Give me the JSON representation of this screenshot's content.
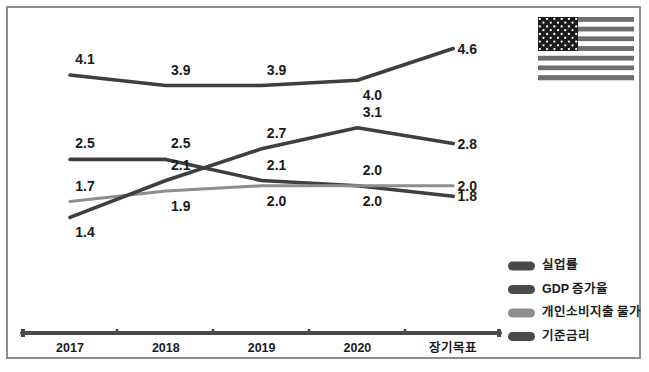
{
  "chart_data": {
    "type": "line",
    "title": "",
    "subtitle": "",
    "xlabel": "",
    "ylabel": "",
    "grid": false,
    "legend_position": "bottom-right",
    "categories": [
      "2017",
      "2018",
      "2019",
      "2020",
      "장기목표"
    ],
    "ylim": [
      1.2,
      4.8
    ],
    "series": [
      {
        "name": "실업률",
        "color": "#3f3f3f",
        "values": [
          4.1,
          3.9,
          3.9,
          4.0,
          4.6
        ],
        "labels": [
          "4.1",
          "3.9",
          "3.9",
          "4.0",
          "4.6"
        ],
        "label_positions": [
          "above",
          "above",
          "above",
          "below",
          "right"
        ]
      },
      {
        "name": "GDP 증가율",
        "color": "#3f3f3f",
        "values": [
          2.5,
          2.5,
          2.1,
          2.0,
          1.8
        ],
        "labels": [
          "2.5",
          "2.5",
          "2.1",
          "2.0",
          "1.8"
        ],
        "label_positions": [
          "above",
          "above",
          "above",
          "above",
          "right"
        ]
      },
      {
        "name": "개인소비지출 물가",
        "color": "#8e8e8e",
        "values": [
          1.7,
          1.9,
          2.0,
          2.0,
          2.0
        ],
        "labels": [
          "1.7",
          "1.9",
          "2.0",
          "2.0",
          "2.0"
        ],
        "label_positions": [
          "above",
          "below",
          "below",
          "below",
          "right"
        ]
      },
      {
        "name": "기준금리",
        "color": "#3f3f3f",
        "values": [
          1.4,
          2.1,
          2.7,
          3.1,
          2.8
        ],
        "labels": [
          "1.4",
          "2.1",
          "2.7",
          "3.1",
          "2.8"
        ],
        "label_positions": [
          "below",
          "above",
          "above",
          "above",
          "right"
        ]
      }
    ]
  },
  "legend": {
    "items": [
      {
        "label": "실업률",
        "color": "#4a4a4a"
      },
      {
        "label": "GDP 증가율",
        "color": "#4a4a4a"
      },
      {
        "label": "개인소비지출 물가",
        "color": "#8e8e8e"
      },
      {
        "label": "기준금리",
        "color": "#4a4a4a"
      }
    ]
  },
  "axis": {
    "tick_labels": [
      "2017",
      "2018",
      "2019",
      "2020",
      "장기목표"
    ],
    "line_color": "#4a4a4a"
  },
  "flag": {
    "name": "united-states-flag",
    "stripe_dark": "#6e6e6e",
    "stripe_light": "#ffffff",
    "canton": "#1b1b1b",
    "star": "#ffffff",
    "stripe_count": 13,
    "star_count": 50
  },
  "annotations": {
    "unemployment_points": [
      {
        "x": "2017",
        "value": "4.1"
      },
      {
        "x": "2018",
        "value": "3.9"
      },
      {
        "x": "2019",
        "value": "3.9"
      },
      {
        "x": "2020",
        "value": "4.0"
      },
      {
        "x": "장기목표",
        "value": "4.6"
      }
    ],
    "gdp_points": [
      {
        "x": "2017",
        "value": "2.5"
      },
      {
        "x": "2018",
        "value": "2.5"
      },
      {
        "x": "2019",
        "value": "2.1"
      },
      {
        "x": "2020",
        "value": "2.0"
      },
      {
        "x": "장기목표",
        "value": "1.8"
      }
    ],
    "pce_points": [
      {
        "x": "2017",
        "value": "1.7"
      },
      {
        "x": "2018",
        "value": "1.9"
      },
      {
        "x": "2019",
        "value": "2.0"
      },
      {
        "x": "2020",
        "value": "2.0"
      },
      {
        "x": "장기목표",
        "value": "2.0"
      }
    ],
    "rate_points": [
      {
        "x": "2017",
        "value": "1.4"
      },
      {
        "x": "2018",
        "value": "2.1"
      },
      {
        "x": "2019",
        "value": "2.7"
      },
      {
        "x": "2020",
        "value": "3.1"
      },
      {
        "x": "장기목표",
        "value": "2.8"
      }
    ]
  }
}
